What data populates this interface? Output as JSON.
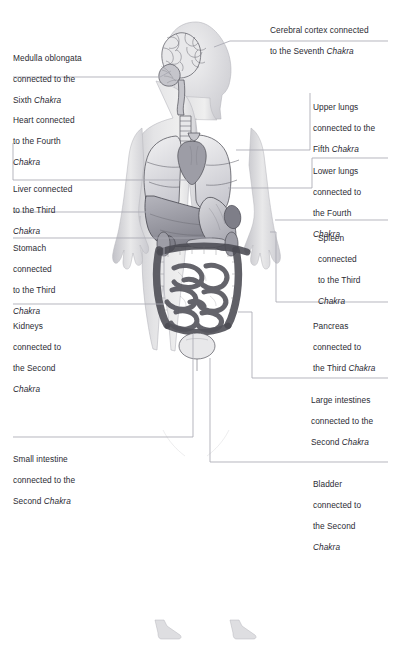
{
  "figure": {
    "view": "anterior full-body anatomical illustration, greyscale",
    "background_color": "#ffffff",
    "text_color": "#2b2b33",
    "leader_line_color": "#a9a9b2"
  },
  "labels_left": [
    {
      "id": "medulla-oblongata",
      "organ": "Medulla oblongata",
      "line1": "Medulla oblongata",
      "line2": "connected to the",
      "line3_plain": "Sixth ",
      "line3_italic": "Chakra",
      "chakra": "Sixth"
    },
    {
      "id": "heart",
      "organ": "Heart",
      "line1": "Heart connected",
      "line2": "to the Fourth",
      "line3_plain": "",
      "line3_italic": "Chakra",
      "chakra": "Fourth"
    },
    {
      "id": "liver",
      "organ": "Liver",
      "line1": "Liver connected",
      "line2": "to the Third",
      "line3_plain": "",
      "line3_italic": "Chakra",
      "chakra": "Third"
    },
    {
      "id": "stomach",
      "organ": "Stomach",
      "line1": "Stomach",
      "line2": "connected",
      "line3": "to the Third",
      "line4_italic": "Chakra",
      "chakra": "Third"
    },
    {
      "id": "kidneys",
      "organ": "Kidneys",
      "line1": "Kidneys",
      "line2": "connected to",
      "line3": "the Second",
      "line4_italic": "Chakra",
      "chakra": "Second"
    },
    {
      "id": "small-intestine",
      "organ": "Small intestine",
      "line1": "Small intestine",
      "line2": "connected to the",
      "line3_plain": "Second ",
      "line3_italic": "Chakra",
      "chakra": "Second"
    }
  ],
  "labels_right": [
    {
      "id": "cerebral-cortex",
      "organ": "Cerebral cortex",
      "line1": "Cerebral cortex connected",
      "line2_plain": "to the Seventh ",
      "line2_italic": "Chakra",
      "chakra": "Seventh"
    },
    {
      "id": "upper-lungs",
      "organ": "Upper lungs",
      "line1": "Upper lungs",
      "line2": "connected to the",
      "line3_plain": "Fifth ",
      "line3_italic": "Chakra",
      "chakra": "Fifth"
    },
    {
      "id": "lower-lungs",
      "organ": "Lower lungs",
      "line1": "Lower lungs",
      "line2": "connected to",
      "line3": "the Fourth",
      "line4_italic": "Chakra",
      "chakra": "Fourth"
    },
    {
      "id": "spleen",
      "organ": "Spleen",
      "line1": "Spleen",
      "line2": "connected",
      "line3": "to the Third",
      "line4_italic": "Chakra",
      "chakra": "Third"
    },
    {
      "id": "pancreas",
      "organ": "Pancreas",
      "line1": "Pancreas",
      "line2": "connected to",
      "line3_plain": "the Third ",
      "line3_italic": "Chakra",
      "chakra": "Third"
    },
    {
      "id": "large-intestines",
      "organ": "Large intestines",
      "line1": "Large intestines",
      "line2": "connected to the",
      "line3_plain": "Second ",
      "line3_italic": "Chakra",
      "chakra": "Second"
    },
    {
      "id": "bladder",
      "organ": "Bladder",
      "line1": "Bladder",
      "line2": "connected to",
      "line3": "the Second",
      "line4_italic": "Chakra",
      "chakra": "Second"
    }
  ]
}
